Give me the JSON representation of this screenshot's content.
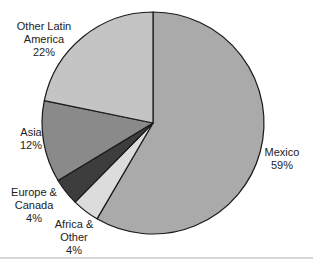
{
  "chart_data": {
    "type": "pie",
    "title": "",
    "start_angle_deg": 0,
    "direction": "clockwise",
    "center": [
      153,
      123
    ],
    "radius": 111,
    "slices": [
      {
        "label": "Mexico",
        "value": 59,
        "display": "59%",
        "color": "#aaaaaa"
      },
      {
        "label": "Africa & Other",
        "value": 4,
        "display": "4%",
        "color": "#dcdcdc"
      },
      {
        "label": "Europe & Canada",
        "value": 4,
        "display": "4%",
        "color": "#3d3d3d"
      },
      {
        "label": "Asia",
        "value": 12,
        "display": "12%",
        "color": "#8a8a8a"
      },
      {
        "label": "Other Latin America",
        "value": 22,
        "display": "22%",
        "color": "#c4c4c4"
      }
    ]
  },
  "labels": {
    "mexico": {
      "line1": "Mexico",
      "line2": "59%"
    },
    "africa": {
      "line1": "Africa &",
      "line2": "Other",
      "line3": "4%"
    },
    "europe": {
      "line1": "Europe &",
      "line2": "Canada",
      "line3": "4%"
    },
    "asia": {
      "line1": "Asia",
      "line2": "12%"
    },
    "latin": {
      "line1": "Other Latin",
      "line2": "America",
      "line3": "22%"
    }
  }
}
